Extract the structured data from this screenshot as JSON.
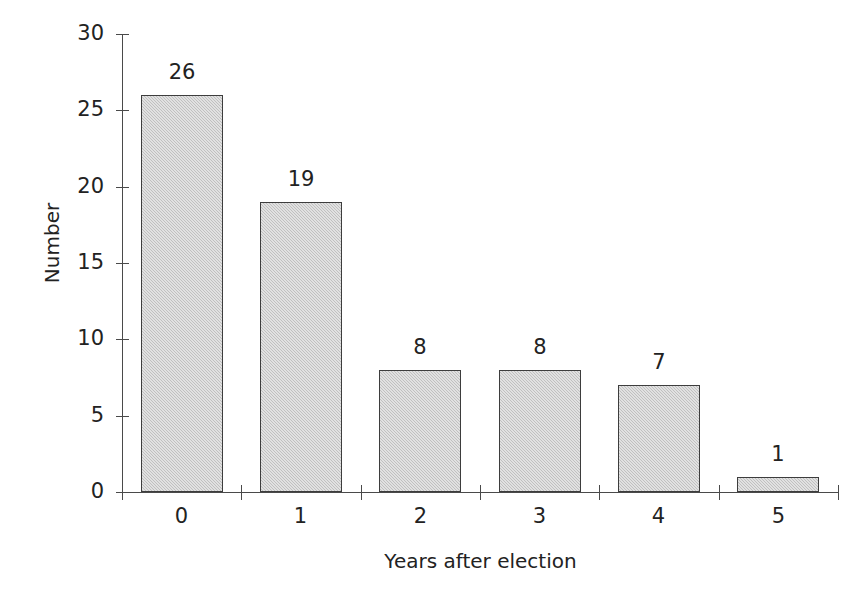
{
  "chart_data": {
    "type": "bar",
    "title": "",
    "categories": [
      "0",
      "1",
      "2",
      "3",
      "4",
      "5"
    ],
    "values": [
      26,
      19,
      8,
      8,
      7,
      1
    ],
    "value_labels": [
      "26",
      "19",
      "8",
      "8",
      "7",
      "1"
    ],
    "xlabel": "Years after election",
    "ylabel": "Number",
    "ylim": [
      0,
      30
    ],
    "ytick_values": [
      0,
      5,
      10,
      15,
      20,
      25,
      30
    ],
    "ytick_labels": [
      "0",
      "5",
      "10",
      "15",
      "20",
      "25",
      "30"
    ],
    "grid": false,
    "legend": false,
    "legend_position": "none",
    "bar_fill_color": "#c9c9c9",
    "bar_border_color": "#3d3d3d",
    "axis_color": "#4a4a4a",
    "background_color": "#ffffff",
    "text_color": "#222222"
  }
}
